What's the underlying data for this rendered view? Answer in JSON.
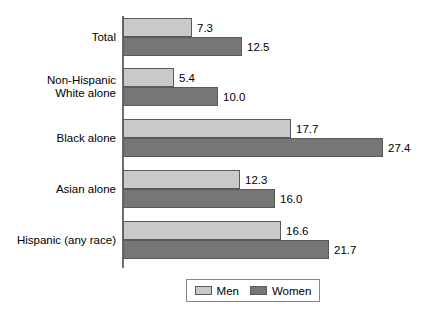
{
  "chart_data": {
    "type": "bar",
    "orientation": "horizontal",
    "title": "",
    "subtitle": "",
    "xlabel": "",
    "ylabel": "",
    "grid": false,
    "xlim": [
      0,
      29
    ],
    "legend_position": "bottom-center",
    "categories": [
      "Total",
      "Non-Hispanic\nWhite alone",
      "Black alone",
      "Asian alone",
      "Hispanic (any race)"
    ],
    "series": [
      {
        "name": "Men",
        "color": "#c9c9c9",
        "values": [
          7.3,
          5.4,
          17.7,
          12.3,
          16.6
        ],
        "value_labels": [
          "7.3",
          "5.4",
          "17.7",
          "12.3",
          "16.6"
        ]
      },
      {
        "name": "Women",
        "color": "#767676",
        "values": [
          12.5,
          10.0,
          27.4,
          16.0,
          21.7
        ],
        "value_labels": [
          "12.5",
          "10.0",
          "27.4",
          "16.0",
          "21.7"
        ]
      }
    ],
    "legend": [
      {
        "label": "Men",
        "color": "#c9c9c9"
      },
      {
        "label": "Women",
        "color": "#767676"
      }
    ]
  },
  "scale": {
    "px_per_unit": 9.5,
    "origin_x": 123
  }
}
